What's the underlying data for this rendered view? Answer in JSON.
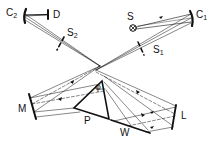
{
  "diagram": {
    "type": "optical-spectrometer-schematic",
    "labels": {
      "C2": {
        "main": "C",
        "sub": "2"
      },
      "D": "D",
      "S2": {
        "main": "S",
        "sub": "2"
      },
      "S": "S",
      "C1": {
        "main": "C",
        "sub": "1"
      },
      "S1": {
        "main": "S",
        "sub": "1"
      },
      "M": "M",
      "P": "P",
      "phi": "φ",
      "W": "W",
      "L": "L"
    },
    "components": [
      {
        "id": "S",
        "role": "source"
      },
      {
        "id": "C1",
        "role": "concave mirror"
      },
      {
        "id": "S1",
        "role": "entrance slit"
      },
      {
        "id": "L",
        "role": "mirror"
      },
      {
        "id": "W",
        "role": "plane mirror"
      },
      {
        "id": "P",
        "role": "prism",
        "angle": "φ"
      },
      {
        "id": "M",
        "role": "mirror"
      },
      {
        "id": "S2",
        "role": "exit slit"
      },
      {
        "id": "C2",
        "role": "concave mirror"
      },
      {
        "id": "D",
        "role": "detector"
      }
    ],
    "colors": {
      "ink": "#111111",
      "background": "#ffffff"
    }
  }
}
